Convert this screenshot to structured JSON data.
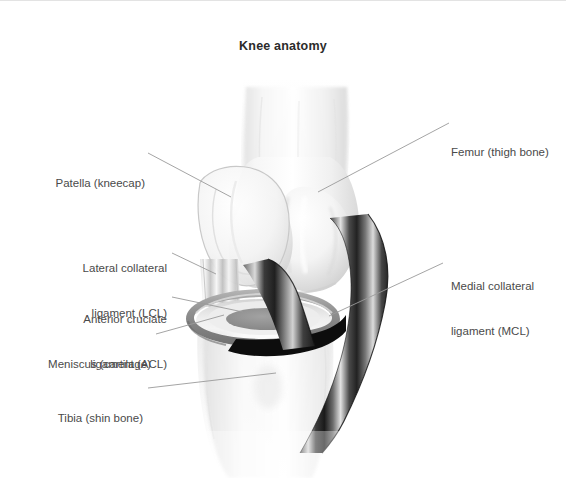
{
  "figure": {
    "title": "Knee anatomy",
    "background_color": "#ffffff",
    "text_color": "#4a4a4a",
    "title_color": "#2b2b2b",
    "leader_line_color": "#9a9a9a",
    "border_color": "#e3e3e3",
    "style": "grayscale medical illustration"
  },
  "labels": {
    "femur": {
      "line1": "Femur (thigh bone)",
      "line2": ""
    },
    "patella": {
      "line1": "Patella (kneecap)",
      "line2": ""
    },
    "lcl": {
      "line1": "Lateral collateral",
      "line2": "ligament (LCL)"
    },
    "acl": {
      "line1": "Anterior cruciate",
      "line2": "ligament (ACL)"
    },
    "meniscus": {
      "line1": "Meniscus (cartilage)",
      "line2": ""
    },
    "tibia": {
      "line1": "Tibia (shin bone)",
      "line2": ""
    },
    "mcl": {
      "line1": "Medial collateral",
      "line2": "ligament (MCL)"
    }
  },
  "structures": [
    {
      "name": "femur",
      "kind": "bone",
      "tone": "#f2f2f2"
    },
    {
      "name": "patella",
      "kind": "bone",
      "tone": "#eeeeee"
    },
    {
      "name": "tibia",
      "kind": "bone",
      "tone": "#f4f4f4"
    },
    {
      "name": "mcl",
      "kind": "ligament",
      "tone": "#2a2a2a"
    },
    {
      "name": "lcl",
      "kind": "ligament",
      "tone": "#c9c9c9"
    },
    {
      "name": "acl",
      "kind": "ligament",
      "tone": "#3a3a3a"
    },
    {
      "name": "meniscus",
      "kind": "cartilage",
      "tone": "#8c8c8c"
    }
  ]
}
